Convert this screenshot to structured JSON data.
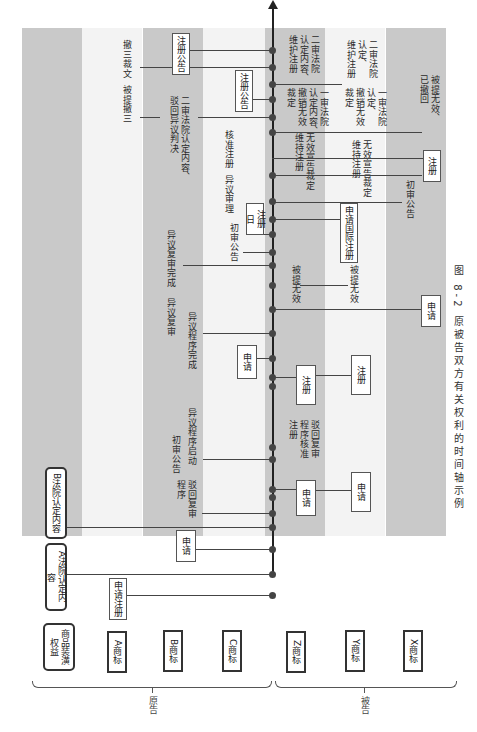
{
  "figure": {
    "caption": "图 8-2  原被告双方有关权利的时间轴示例",
    "orientation": "rotated 90° clockwise; time flows bottom-to-top along the central arrow",
    "groups": {
      "plaintiff": "原告",
      "defendant": "被告"
    }
  },
  "lanes": [
    {
      "id": "goodwill",
      "label": "商品装潢\n权益",
      "side": "plaintiff"
    },
    {
      "id": "A",
      "label": "A商标",
      "side": "plaintiff"
    },
    {
      "id": "B",
      "label": "B商标",
      "side": "plaintiff"
    },
    {
      "id": "C",
      "label": "C商标",
      "side": "plaintiff"
    },
    {
      "id": "Z",
      "label": "Z商标",
      "side": "defendant"
    },
    {
      "id": "Y",
      "label": "Y商标",
      "side": "defendant"
    },
    {
      "id": "X",
      "label": "X商标",
      "side": "defendant"
    }
  ],
  "events": {
    "goodwill": {
      "a_court": "A法院认定内容",
      "b_court": "B法院认定内容"
    },
    "A": {
      "apply": "申请注册",
      "revoke": "被提撤三",
      "revoke3": "撤三裁文"
    },
    "B": {
      "apply": "申请",
      "review": "驳回复审\n程序",
      "prelim": "初审公告",
      "opp_start": "异议程序启动",
      "opp_done": "异议程序完成",
      "opp_review": "异议复审",
      "opp_review_done": "异议复审完成",
      "second_court": "二审法院认定内容、\n驳回异议判决",
      "reg_notice": "注册公告"
    },
    "C": {
      "apply": "申请",
      "prelim": "初审公告",
      "opp": "异议审理",
      "approve": "核准注册",
      "reg_day": "注册日",
      "reg_notice": "注册公告"
    },
    "Z": {
      "apply": "申请",
      "review": "驳回复审\n程序核准\n注册",
      "register": "注册",
      "invalid": "被提无效",
      "intl": "申请国际注册",
      "inval_ruling": "无效宣告裁定\n维持注册",
      "first_court": "一审法院\n认定内容、\n撤销无效\n裁定",
      "second_court": "二审法院\n认定内容、\n维护注册"
    },
    "Y": {
      "apply": "申请",
      "register": "注册",
      "invalid": "被提无效",
      "inval_ruling": "无效宣告裁定\n维持注册",
      "first_court": "一审法院\n认定、\n撤销无效\n裁定",
      "second_court": "二审法院\n认定、\n维护注册"
    },
    "X": {
      "apply": "申请",
      "prelim": "初审公告",
      "register": "注册",
      "withdrawn": "被提无效、\n已撤回"
    }
  }
}
